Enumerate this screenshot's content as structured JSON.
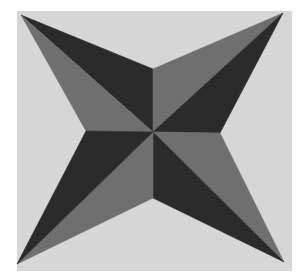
{
  "image": {
    "subject": "four-pointed star quilt block",
    "colors": {
      "page": "#ffffff",
      "block_background": "#d6d6d6",
      "dark": "#2b2b2b",
      "medium": "#6f6f6f"
    },
    "block": {
      "x": 17,
      "y": 11,
      "width": 275,
      "height": 260
    },
    "center": [
      153,
      132
    ],
    "notches": {
      "top": [
        153,
        69
      ],
      "right": [
        220,
        133
      ],
      "bottom": [
        153,
        198
      ],
      "left": [
        86,
        131
      ]
    },
    "tips": {
      "top_left": [
        21,
        15
      ],
      "top_right": [
        283,
        13
      ],
      "bottom_right": [
        284,
        262
      ],
      "bottom_left": [
        17,
        264
      ]
    }
  }
}
